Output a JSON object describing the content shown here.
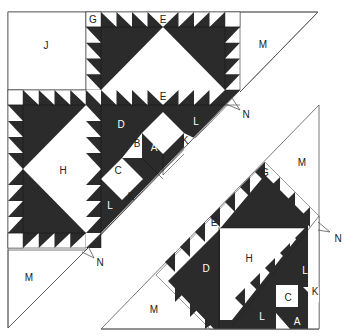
{
  "diagram": {
    "colors": {
      "dark": "#2b2b2b",
      "light": "#ffffff",
      "outline": "#555555"
    },
    "labels": {
      "J": "J",
      "G_top": "G",
      "E_top": "E",
      "M_top_right": "M",
      "E_mid": "E",
      "D_mid": "D",
      "B_mid": "B",
      "A_mid": "A",
      "L_mid_upper": "L",
      "K_mid_upper": "K",
      "C_mid": "C",
      "K_mid_lower": "K",
      "L_mid_lower": "L",
      "H_left": "H",
      "N_upper": "N",
      "M_bottom_left": "M",
      "N_lower": "N",
      "M_right_piece": "M",
      "G_right_piece": "G",
      "E_right_piece": "E",
      "H_right_piece": "H",
      "D_right_piece": "D",
      "L_right_upper": "L",
      "K_right": "K",
      "C_right": "C",
      "L_right_lower": "L",
      "A_right": "A",
      "M_right_bottom": "M",
      "N_right": "N"
    }
  }
}
